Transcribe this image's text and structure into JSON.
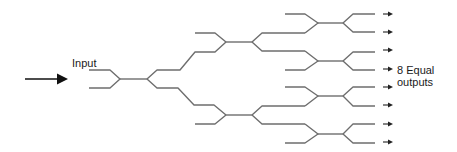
{
  "labels": {
    "input": "Input",
    "output_line1": "8 Equal",
    "output_line2": "outputs"
  },
  "diagram": {
    "type": "1x8 optical power splitter tree (cascaded Y-junctions)",
    "stages": 3,
    "input_count": 1,
    "output_count": 8,
    "colors": {
      "waveguide": "#6e6e6e",
      "arrow": "#111111",
      "text": "#1a1a1a"
    },
    "icons": [
      "input-arrow-icon",
      "output-arrow-icon"
    ]
  }
}
